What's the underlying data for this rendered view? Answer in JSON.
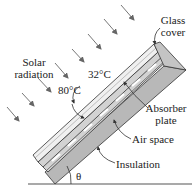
{
  "labels": {
    "solar_radiation_line1": "Solar",
    "solar_radiation_line2": "radiation",
    "glass_cover_line1": "Glass",
    "glass_cover_line2": "cover",
    "temp_glass": "32°C",
    "temp_absorber": "80°C",
    "absorber_line1": "Absorber",
    "absorber_line2": "plate",
    "air_space": "Air space",
    "insulation": "Insulation",
    "angle": "θ"
  },
  "colors": {
    "glass": "#eeeeee",
    "air_space": "#d4d4d4",
    "insulation": "#b8b8b8",
    "outline": "#333333",
    "arrows": "#777777"
  }
}
